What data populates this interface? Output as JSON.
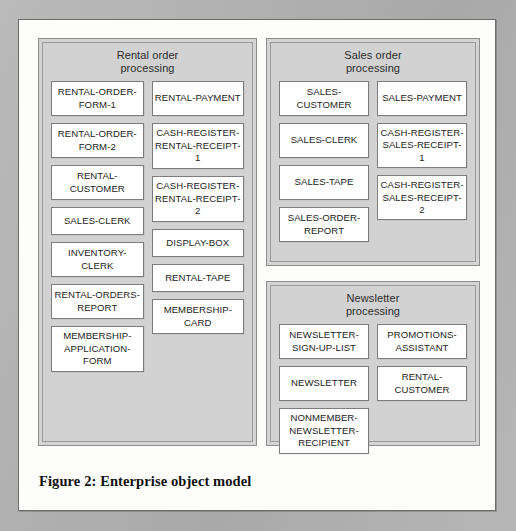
{
  "figure": {
    "caption": "Figure 2: Enterprise object model"
  },
  "colors": {
    "page_background": "#b2b2b2",
    "frame_background": "#fdfdfb",
    "frame_border": "#6c6c6c",
    "group_background": "#d2d2d2",
    "group_border": "#8e8e8e",
    "entity_background": "#ffffff",
    "entity_border": "#7d7d7d",
    "text": "#242424"
  },
  "groups": [
    {
      "id": "rental",
      "title": "Rental order\nprocessing",
      "title_line1": "Rental order",
      "title_line2": "processing",
      "columns": [
        {
          "entities": [
            "RENTAL-ORDER-FORM-1",
            "RENTAL-ORDER-FORM-2",
            "RENTAL-CUSTOMER",
            "SALES-CLERK",
            "INVENTORY-CLERK",
            "RENTAL-ORDERS-REPORT",
            "MEMBERSHIP-APPLICATION-FORM"
          ]
        },
        {
          "entities": [
            "RENTAL-PAYMENT",
            "CASH-REGISTER-RENTAL-RECEIPT-1",
            "CASH-REGISTER-RENTAL-RECEIPT-2",
            "DISPLAY-BOX",
            "RENTAL-TAPE",
            "MEMBERSHIP-CARD"
          ]
        }
      ]
    },
    {
      "id": "sales",
      "title": "Sales order\nprocessing",
      "title_line1": "Sales order",
      "title_line2": "processing",
      "columns": [
        {
          "entities": [
            "SALES-CUSTOMER",
            "SALES-CLERK",
            "SALES-TAPE",
            "SALES-ORDER-REPORT"
          ]
        },
        {
          "entities": [
            "SALES-PAYMENT",
            "CASH-REGISTER-SALES-RECEIPT-1",
            "CASH-REGISTER-SALES-RECEIPT-2"
          ]
        }
      ]
    },
    {
      "id": "newsletter",
      "title": "Newsletter\nprocessing",
      "title_line1": "Newsletter",
      "title_line2": "processing",
      "columns": [
        {
          "entities": [
            "NEWSLETTER-SIGN-UP-LIST",
            "NEWSLETTER",
            "NONMEMBER-NEWSLETTER-RECIPIENT"
          ]
        },
        {
          "entities": [
            "PROMOTIONS-ASSISTANT",
            "RENTAL-CUSTOMER"
          ]
        }
      ]
    }
  ]
}
